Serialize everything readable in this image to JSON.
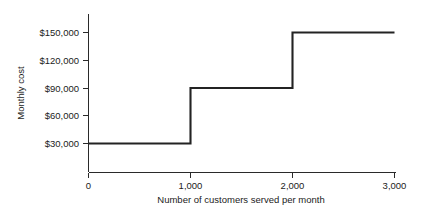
{
  "chart_data": {
    "type": "line",
    "subtype": "step",
    "title": "",
    "xlabel": "Number of customers served per month",
    "ylabel": "Monthly cost",
    "xlim": [
      0,
      3000
    ],
    "ylim": [
      0,
      165000
    ],
    "grid": false,
    "legend": false,
    "x_ticks": [
      0,
      1000,
      2000,
      3000
    ],
    "x_tick_labels": [
      "0",
      "1,000",
      "2,000",
      "3,000"
    ],
    "y_ticks": [
      30000,
      60000,
      90000,
      120000,
      150000
    ],
    "y_tick_labels": [
      "$30,000",
      "$60,000",
      "$90,000",
      "$120,000",
      "$150,000"
    ],
    "line_color": "#232323",
    "steps": [
      {
        "x_start": 0,
        "x_end": 1000,
        "y": 30000
      },
      {
        "x_start": 1000,
        "x_end": 2000,
        "y": 90000
      },
      {
        "x_start": 2000,
        "x_end": 3000,
        "y": 150000
      }
    ],
    "x": [
      0,
      1000,
      1000,
      2000,
      2000,
      3000
    ],
    "y": [
      30000,
      30000,
      90000,
      90000,
      150000,
      150000
    ]
  },
  "axes": {
    "y_title": "Monthly cost",
    "x_title": "Number of customers served per month",
    "y_labels": {
      "l0": "$150,000",
      "l1": "$120,000",
      "l2": "$90,000",
      "l3": "$60,000",
      "l4": "$30,000"
    },
    "x_labels": {
      "t0": "0",
      "t1": "1,000",
      "t2": "2,000",
      "t3": "3,000"
    }
  }
}
